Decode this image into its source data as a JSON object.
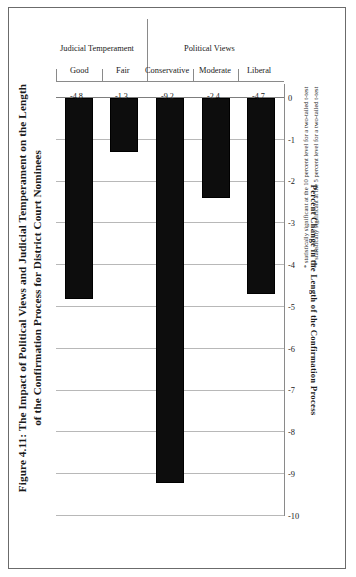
{
  "figure": {
    "title_line1": "Figure 4.11: The Impact of Political Views and Judicial Temperament on the Length",
    "title_line2": "of the Confirmation Process for District Court Nominees"
  },
  "footnotes": {
    "note1": "* statistically significant at the 10 percent level for a two-tailed t-test",
    "note2": "** statistically significant at the 5 percent level for a two-tailed t-test"
  },
  "chart_data": {
    "type": "bar",
    "orientation": "horizontal",
    "title": "Figure 4.11: The Impact of Political Views and Judicial Temperament on the Length of the Confirmation Process for District Court Nominees",
    "xlabel": "Percent Change in the Length of the Confirmation Process",
    "ylabel": "",
    "xlim": [
      0,
      -10
    ],
    "grid": true,
    "legend": "none",
    "categories": [
      "Liberal",
      "Moderate",
      "Conservative",
      "Fair",
      "Good"
    ],
    "values": [
      -4.7,
      -2.4,
      -9.2,
      -1.3,
      -4.8
    ],
    "value_labels": [
      "-4.7",
      "-2.4",
      "-9.2",
      "-1.3",
      "-4.8"
    ],
    "groups": [
      {
        "name": "Political Views",
        "categories": [
          "Liberal",
          "Moderate",
          "Conservative"
        ]
      },
      {
        "name": "Judicial Temperament",
        "categories": [
          "Fair",
          "Good"
        ]
      }
    ],
    "tick_labels": [
      "0",
      "-1",
      "-2",
      "-3",
      "-4",
      "-5",
      "-6",
      "-7",
      "-8",
      "-9",
      "-10"
    ],
    "tick_values": [
      0,
      -1,
      -2,
      -3,
      -4,
      -5,
      -6,
      -7,
      -8,
      -9,
      -10
    ],
    "bar_color": "#0d0d0d",
    "grid_color": "#b8b8b8"
  }
}
